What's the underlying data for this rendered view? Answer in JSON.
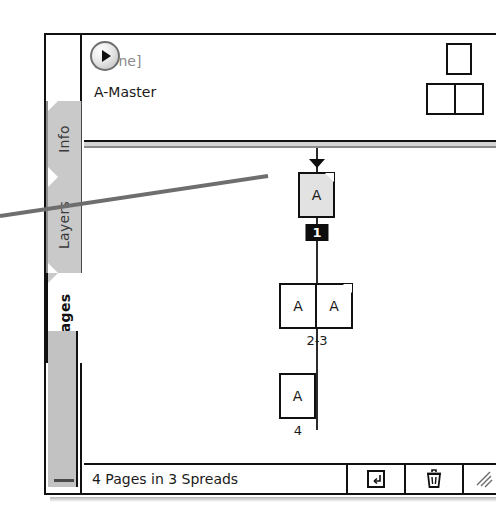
{
  "panel": {
    "title": "Pages",
    "menu_button_icon": "panel-menu-triangle-icon"
  },
  "tabs": [
    {
      "label": "Info",
      "active": false
    },
    {
      "label": "Layers",
      "active": false
    },
    {
      "label": "Pages",
      "active": true
    }
  ],
  "masters": {
    "rows": [
      {
        "name": "[None]",
        "style": "none"
      },
      {
        "name": "A-Master",
        "style": "master"
      }
    ],
    "thumbnails": {
      "single_icon": "master-page-single-icon",
      "spread_icon": "master-page-spread-icon"
    }
  },
  "pages": [
    {
      "id": "page-1",
      "label": "1",
      "label_style": "badge",
      "selected": true,
      "marker": "current-spread-marker",
      "icons": [
        {
          "glyph": "A"
        }
      ]
    },
    {
      "id": "spread-2-3",
      "label": "2-3",
      "label_style": "plain",
      "selected": false,
      "marker": null,
      "icons": [
        {
          "glyph": "A"
        },
        {
          "glyph": "A"
        }
      ]
    },
    {
      "id": "page-4",
      "label": "4",
      "label_style": "plain",
      "selected": false,
      "marker": null,
      "icons": [
        {
          "glyph": "A"
        }
      ]
    }
  ],
  "statusbar": {
    "text": "4 Pages in 3 Spreads",
    "buttons": [
      {
        "name": "new-page-button",
        "icon": "new-page-icon"
      },
      {
        "name": "delete-page-button",
        "icon": "trash-icon"
      }
    ],
    "grip": "resize-grip-icon"
  },
  "annotation": {
    "leader_line": "callout-leader-line",
    "color": "#6e6e6e"
  }
}
